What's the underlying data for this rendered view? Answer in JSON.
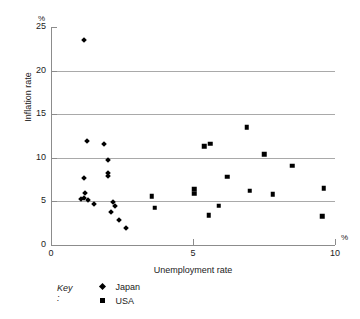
{
  "chart_data": {
    "type": "scatter",
    "title": "",
    "xlabel": "Unemployment rate",
    "ylabel": "Inflation rate",
    "x_unit": "%",
    "y_unit": "%",
    "xlim": [
      0,
      10
    ],
    "ylim": [
      0,
      25
    ],
    "x_ticks": [
      "0",
      "5",
      "10"
    ],
    "x_tick_values": [
      0,
      5,
      10
    ],
    "y_ticks": [
      "0",
      "5",
      "10",
      "15",
      "20",
      "25"
    ],
    "y_tick_values": [
      0,
      5,
      10,
      15,
      20,
      25
    ],
    "grid": "horizontal gridlines at 5, 10, 15, 20",
    "gridline_values": [
      5,
      10,
      15,
      20
    ],
    "legend_position": "below-left",
    "legend_title": "Key :",
    "series": [
      {
        "name": "Japan",
        "marker": "diamond",
        "color": "#000000",
        "points": [
          [
            1.15,
            23.5
          ],
          [
            1.25,
            11.9
          ],
          [
            1.85,
            11.6
          ],
          [
            2.0,
            9.8
          ],
          [
            2.0,
            8.2
          ],
          [
            2.0,
            7.9
          ],
          [
            1.15,
            7.7
          ],
          [
            1.2,
            6.0
          ],
          [
            1.15,
            5.4
          ],
          [
            1.05,
            5.3
          ],
          [
            1.3,
            5.2
          ],
          [
            1.5,
            4.7
          ],
          [
            2.2,
            4.9
          ],
          [
            2.25,
            4.5
          ],
          [
            2.1,
            3.8
          ],
          [
            2.4,
            2.9
          ],
          [
            2.65,
            2.0
          ]
        ]
      },
      {
        "name": "USA",
        "marker": "square",
        "color": "#000000",
        "points": [
          [
            5.4,
            11.3
          ],
          [
            5.6,
            11.6
          ],
          [
            6.9,
            13.5
          ],
          [
            5.05,
            6.4
          ],
          [
            5.05,
            5.9
          ],
          [
            3.55,
            5.6
          ],
          [
            3.65,
            4.3
          ],
          [
            6.2,
            7.8
          ],
          [
            7.0,
            6.2
          ],
          [
            7.5,
            10.4
          ],
          [
            7.8,
            5.8
          ],
          [
            5.9,
            4.5
          ],
          [
            5.55,
            3.4
          ],
          [
            8.5,
            9.1
          ],
          [
            9.6,
            6.5
          ],
          [
            9.55,
            3.3
          ]
        ]
      }
    ]
  }
}
